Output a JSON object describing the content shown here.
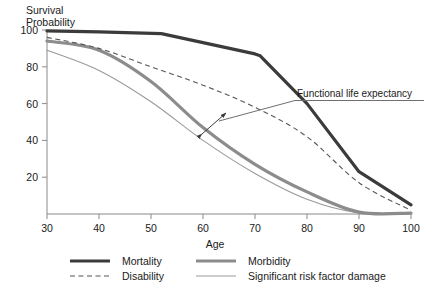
{
  "chart_data": {
    "type": "line",
    "title": "",
    "xlabel": "Age",
    "ylabel_line1": "Survival",
    "ylabel_line2": "Probability",
    "xlim": [
      30,
      100
    ],
    "ylim": [
      0,
      100
    ],
    "xticks": [
      30,
      40,
      50,
      60,
      70,
      80,
      90,
      100
    ],
    "yticks": [
      20,
      40,
      60,
      80,
      100
    ],
    "grid": false,
    "legend_position": "below-axes",
    "series": [
      {
        "name": "Mortality",
        "style": "solid-thick",
        "color": "#3b3b3b",
        "x": [
          30,
          40,
          52,
          70,
          71,
          80,
          90,
          100
        ],
        "values": [
          99.5,
          99,
          98,
          87,
          86,
          60,
          23,
          5
        ]
      },
      {
        "name": "Disability",
        "style": "dashed-thin",
        "color": "#555555",
        "x": [
          30,
          40,
          50,
          60,
          70,
          80,
          90,
          100
        ],
        "values": [
          96,
          90,
          80,
          70,
          58,
          42,
          17,
          2
        ]
      },
      {
        "name": "Morbidity",
        "style": "solid-thick",
        "color": "#8c8c8c",
        "x": [
          30,
          40,
          50,
          60,
          70,
          80,
          90,
          100
        ],
        "values": [
          94,
          89,
          72,
          47,
          27,
          12,
          1,
          0.5
        ]
      },
      {
        "name": "Significant risk factor damage",
        "style": "solid-thin",
        "color": "#9a9a9a",
        "x": [
          30,
          40,
          50,
          60,
          70,
          80,
          90,
          100
        ],
        "values": [
          89,
          78,
          61,
          40,
          22,
          8,
          0.5,
          0.3
        ]
      }
    ],
    "annotations": [
      {
        "text": "Functional life expectancy",
        "x_px": 297,
        "y_px": 96,
        "underline": true,
        "leader_to_arrow": true,
        "arrow_type": "double-headed",
        "arrow_from_series": "Morbidity",
        "arrow_to_series": "Disability"
      }
    ]
  },
  "legend": {
    "entries": [
      {
        "label": "Mortality",
        "swatch": "solid-thick-dark",
        "color": "#3b3b3b"
      },
      {
        "label": "Morbidity",
        "swatch": "solid-thick-gray",
        "color": "#8c8c8c"
      },
      {
        "label": "Disability",
        "swatch": "dashed-thin-dark",
        "color": "#555555"
      },
      {
        "label": "Significant risk factor damage",
        "swatch": "solid-thin-gray",
        "color": "#9a9a9a"
      }
    ]
  },
  "axes": {
    "x_label": "Age",
    "y_label_line1": "Survival",
    "y_label_line2": "Probability",
    "x_tick_labels": [
      "30",
      "40",
      "50",
      "60",
      "70",
      "80",
      "90",
      "100"
    ],
    "y_tick_labels": [
      "100",
      "80",
      "60",
      "40",
      "20"
    ]
  },
  "colors": {
    "background": "#ffffff",
    "axis": "#8a8a8a",
    "text": "#1a1a1a",
    "mortality": "#3b3b3b",
    "disability": "#555555",
    "morbidity": "#8c8c8c",
    "risk_factor": "#9a9a9a"
  }
}
